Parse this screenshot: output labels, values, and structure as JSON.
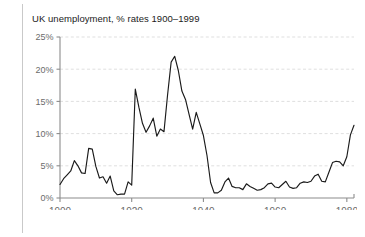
{
  "chart_data": {
    "type": "line",
    "title": "UK unemployment, % rates 1900–1999",
    "xlabel": "",
    "ylabel": "",
    "xlim": [
      1900,
      1982
    ],
    "ylim": [
      0,
      25
    ],
    "grid": true,
    "legend": "none",
    "series_color": "#1a1a1a",
    "y_ticks": [
      0,
      5,
      10,
      15,
      20,
      25
    ],
    "y_tick_labels": [
      "0%",
      "5%",
      "10%",
      "15%",
      "20%",
      "25%"
    ],
    "x_ticks": [
      1900,
      1920,
      1940,
      1960,
      1980
    ],
    "x_tick_labels": [
      "1900",
      "1920",
      "1940",
      "1960",
      "1980"
    ],
    "series": [
      {
        "name": "UK unemployment rate",
        "x": [
          1900,
          1901,
          1902,
          1903,
          1904,
          1905,
          1906,
          1907,
          1908,
          1909,
          1910,
          1911,
          1912,
          1913,
          1914,
          1915,
          1916,
          1917,
          1918,
          1919,
          1920,
          1921,
          1922,
          1923,
          1924,
          1925,
          1926,
          1927,
          1928,
          1929,
          1930,
          1931,
          1932,
          1933,
          1934,
          1935,
          1936,
          1937,
          1938,
          1939,
          1940,
          1941,
          1942,
          1943,
          1944,
          1945,
          1946,
          1947,
          1948,
          1949,
          1950,
          1951,
          1952,
          1953,
          1954,
          1955,
          1956,
          1957,
          1958,
          1959,
          1960,
          1961,
          1962,
          1963,
          1964,
          1965,
          1966,
          1967,
          1968,
          1969,
          1970,
          1971,
          1972,
          1973,
          1974,
          1975,
          1976,
          1977,
          1978,
          1979,
          1980,
          1981,
          1982
        ],
        "values": [
          2.1,
          3.0,
          3.6,
          4.2,
          5.8,
          5.0,
          3.9,
          3.8,
          7.7,
          7.6,
          4.9,
          3.1,
          3.3,
          2.3,
          3.4,
          1.1,
          0.5,
          0.6,
          0.6,
          2.5,
          2.0,
          16.9,
          14.1,
          11.6,
          10.2,
          11.2,
          12.4,
          9.6,
          10.7,
          10.3,
          16.0,
          21.1,
          22.0,
          19.8,
          16.6,
          15.3,
          13.0,
          10.7,
          13.3,
          11.5,
          9.7,
          6.6,
          2.4,
          0.8,
          0.8,
          1.2,
          2.5,
          3.1,
          1.8,
          1.6,
          1.6,
          1.3,
          2.2,
          1.8,
          1.5,
          1.2,
          1.3,
          1.6,
          2.2,
          2.3,
          1.7,
          1.6,
          2.1,
          2.6,
          1.7,
          1.5,
          1.6,
          2.3,
          2.5,
          2.4,
          2.6,
          3.4,
          3.7,
          2.6,
          2.5,
          4.0,
          5.5,
          5.7,
          5.6,
          5.0,
          6.4,
          9.8,
          11.3
        ]
      }
    ]
  }
}
